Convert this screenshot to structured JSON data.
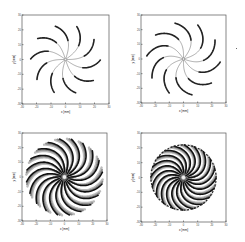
{
  "chart_data": [
    {
      "type": "scatter",
      "panel": "top-left",
      "title": "",
      "xlabel": "x [mm]",
      "ylabel": "y [mm]",
      "xlim": [
        -30,
        30
      ],
      "ylim": [
        -30,
        30
      ],
      "xticks": [
        -30,
        -20,
        -10,
        0,
        10,
        20,
        30
      ],
      "yticks": [
        -30,
        -20,
        -10,
        0,
        10,
        20,
        30
      ],
      "grid": false,
      "series": [
        {
          "name": "spiral trajectories",
          "arms": 10,
          "outer_radius_mm": 24,
          "twist_deg": 35,
          "fill": "thin"
        }
      ]
    },
    {
      "type": "scatter",
      "panel": "top-right",
      "title": "",
      "xlabel": "x [mm]",
      "ylabel": "y [mm]",
      "xlim": [
        -30,
        30
      ],
      "ylim": [
        -30,
        30
      ],
      "xticks": [
        -30,
        -20,
        -10,
        0,
        10,
        20,
        30
      ],
      "yticks": [
        -30,
        -20,
        -10,
        0,
        10,
        20,
        30
      ],
      "grid": false,
      "series": [
        {
          "name": "spiral trajectories",
          "arms": 10,
          "outer_radius_mm": 26,
          "twist_deg": 50,
          "fill": "thin"
        }
      ]
    },
    {
      "type": "scatter",
      "panel": "bottom-left",
      "title": "",
      "xlabel": "x [mm]",
      "ylabel": "y [mm]",
      "xlim": [
        -30,
        30
      ],
      "ylim": [
        -30,
        30
      ],
      "xticks": [
        -30,
        -20,
        -10,
        0,
        10,
        20,
        30
      ],
      "yticks": [
        -30,
        -20,
        -10,
        0,
        10,
        20,
        30
      ],
      "grid": false,
      "series": [
        {
          "name": "spiral trajectories",
          "arms": 20,
          "outer_radius_mm": 27,
          "twist_deg": 45,
          "fill": "dense"
        }
      ]
    },
    {
      "type": "scatter",
      "panel": "bottom-right",
      "title": "",
      "xlabel": "x [mm]",
      "ylabel": "y [mm]",
      "xlim": [
        -30,
        30
      ],
      "ylim": [
        -30,
        30
      ],
      "xticks": [
        -30,
        -20,
        -10,
        0,
        10,
        20,
        30
      ],
      "yticks": [
        -30,
        -20,
        -10,
        0,
        10,
        20,
        30
      ],
      "grid": false,
      "series": [
        {
          "name": "spiral trajectories",
          "arms": 20,
          "outer_radius_mm": 23,
          "twist_deg": 55,
          "fill": "dense-ring"
        }
      ]
    }
  ],
  "labels": {
    "x": "x [mm]",
    "y": "y [mm]"
  }
}
